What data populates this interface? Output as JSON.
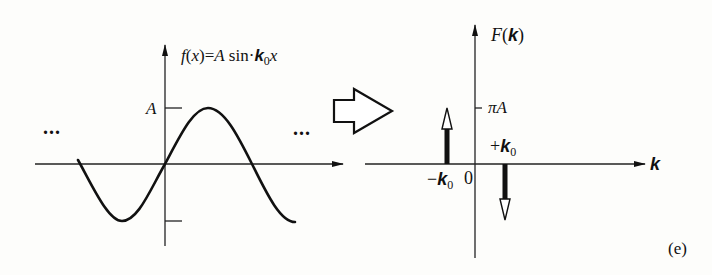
{
  "left_panel": {
    "function_label": {
      "f": "f",
      "lparen": "(",
      "x": "x",
      "rparen": ")",
      "eq": "=",
      "amp": "A",
      "sin": " sin",
      "k": "k",
      "k_sub": "0",
      "var": "x"
    },
    "amplitude_label": "A",
    "ellipsis_left": "...",
    "ellipsis_right": "...",
    "curve": "sine",
    "colors": {
      "stroke": "#111111"
    }
  },
  "transform_arrow": {
    "icon": "hollow-right-arrow-icon"
  },
  "right_panel": {
    "y_axis_label": {
      "F": "F",
      "lparen": "(",
      "k": "k",
      "rparen": ")"
    },
    "tick_label_piA": {
      "pi": "π",
      "A": "A"
    },
    "plus_k0": {
      "sign": "+",
      "k": "k",
      "sub": "0"
    },
    "minus_k0": {
      "sign": "−",
      "k": "k",
      "sub": "0"
    },
    "origin_label": "0",
    "x_axis_label": "k",
    "impulses": [
      {
        "position": "-k0",
        "direction": "up",
        "height": "πA"
      },
      {
        "position": "+k0",
        "direction": "down",
        "height": "-πA"
      }
    ]
  },
  "panel_tag": "(e)"
}
